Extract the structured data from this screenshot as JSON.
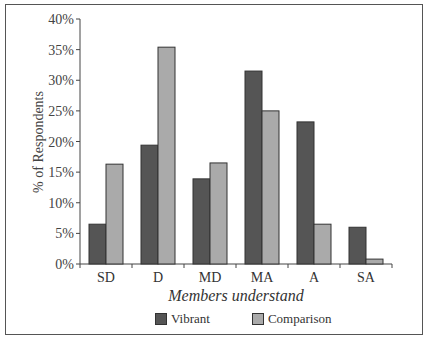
{
  "chart_data": {
    "type": "bar",
    "title": "",
    "xlabel": "Members understand",
    "ylabel": "% of Respondents",
    "categories": [
      "SD",
      "D",
      "MD",
      "MA",
      "A",
      "SA"
    ],
    "series": [
      {
        "name": "Vibrant",
        "color": "#555555",
        "values": [
          6.5,
          19.4,
          13.9,
          31.5,
          23.2,
          6.0
        ]
      },
      {
        "name": "Comparison",
        "color": "#aaaaaa",
        "values": [
          16.3,
          35.4,
          16.5,
          25.0,
          6.5,
          0.8
        ]
      }
    ],
    "ylim": [
      0,
      40
    ],
    "yticks": [
      "0%",
      "5%",
      "10%",
      "15%",
      "20%",
      "25%",
      "30%",
      "35%",
      "40%"
    ],
    "grid": false,
    "legend_position": "bottom"
  },
  "legend": {
    "items": [
      {
        "label": "Vibrant",
        "color": "#555555"
      },
      {
        "label": "Comparison",
        "color": "#aaaaaa"
      }
    ]
  }
}
